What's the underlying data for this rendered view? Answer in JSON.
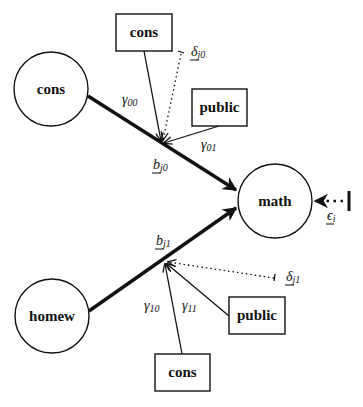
{
  "diagram": {
    "title": "",
    "nodes": {
      "cons_level1": {
        "label": "cons",
        "shape": "circle"
      },
      "homew_level1": {
        "label": "homew",
        "shape": "circle"
      },
      "math_outcome": {
        "label": "math",
        "shape": "circle"
      },
      "cons_top_box": {
        "label": "cons",
        "shape": "rect"
      },
      "public_top_box": {
        "label": "public",
        "shape": "rect"
      },
      "public_bottom_box": {
        "label": "public",
        "shape": "rect"
      },
      "cons_bottom_box": {
        "label": "cons",
        "shape": "rect"
      }
    },
    "edge_labels": {
      "gamma00": {
        "base": "γ",
        "sub": "00"
      },
      "gamma01": {
        "base": "γ",
        "sub": "01"
      },
      "gamma10": {
        "base": "γ",
        "sub": "10"
      },
      "gamma11": {
        "base": "γ",
        "sub": "11"
      },
      "b_j0": {
        "base": "b",
        "sub": "j0"
      },
      "b_j1": {
        "base": "b",
        "sub": "j1"
      },
      "delta_j0": {
        "base": "δ",
        "sub": "j0"
      },
      "delta_j1": {
        "base": "δ",
        "sub": "j1"
      },
      "epsilon_i": {
        "base": "ϵ",
        "sub": "i"
      }
    },
    "edges": [
      {
        "from": "cons_level1",
        "to": "math_outcome",
        "style": "thick",
        "coefficient": "b_j0"
      },
      {
        "from": "homew_level1",
        "to": "math_outcome",
        "style": "thick",
        "coefficient": "b_j1"
      },
      {
        "from": "cons_top_box",
        "to": "b_j0",
        "style": "thin",
        "label": "gamma00"
      },
      {
        "from": "public_top_box",
        "to": "b_j0",
        "style": "thin",
        "label": "gamma01"
      },
      {
        "from": "delta_j0",
        "to": "b_j0",
        "style": "dotted"
      },
      {
        "from": "cons_bottom_box",
        "to": "b_j1",
        "style": "thin",
        "label": "gamma10"
      },
      {
        "from": "public_bottom_box",
        "to": "b_j1",
        "style": "thin",
        "label": "gamma11"
      },
      {
        "from": "delta_j1",
        "to": "b_j1",
        "style": "dotted"
      },
      {
        "from": "epsilon_i",
        "to": "math_outcome",
        "style": "dotted-heavy"
      }
    ],
    "colors": {
      "ink": "#111111",
      "background": "#ffffff"
    }
  }
}
